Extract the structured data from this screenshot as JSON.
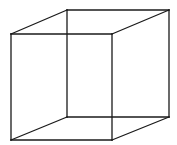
{
  "diagram": {
    "type": "necker-cube",
    "background": "#ffffff",
    "stroke_color": "#1a1a1a",
    "vertices": {
      "front_top_left": [
        11,
        34
      ],
      "front_top_right": [
        112,
        34
      ],
      "front_bottom_left": [
        11,
        140
      ],
      "front_bottom_right": [
        112,
        140
      ],
      "back_top_left": [
        67,
        10
      ],
      "back_top_right": [
        169,
        10
      ],
      "back_bottom_left": [
        67,
        117
      ],
      "back_bottom_right": [
        169,
        117
      ]
    },
    "edges": [
      [
        "front_top_left",
        "front_top_right"
      ],
      [
        "front_top_right",
        "front_bottom_right"
      ],
      [
        "front_bottom_right",
        "front_bottom_left"
      ],
      [
        "front_bottom_left",
        "front_top_left"
      ],
      [
        "back_top_left",
        "back_top_right"
      ],
      [
        "back_top_right",
        "back_bottom_right"
      ],
      [
        "back_bottom_right",
        "back_bottom_left"
      ],
      [
        "back_bottom_left",
        "back_top_left"
      ],
      [
        "front_top_left",
        "back_top_left"
      ],
      [
        "front_top_right",
        "back_top_right"
      ],
      [
        "front_bottom_left",
        "back_bottom_left"
      ],
      [
        "front_bottom_right",
        "back_bottom_right"
      ]
    ]
  }
}
